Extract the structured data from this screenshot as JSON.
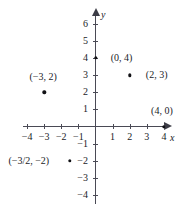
{
  "chart_data": {
    "type": "scatter",
    "title": "",
    "xlabel": "x",
    "ylabel": "y",
    "xlim": [
      -4.6,
      4.4
    ],
    "ylim": [
      -4.6,
      6.6
    ],
    "grid": false,
    "legend": "none",
    "x_ticks": [
      {
        "value": -4,
        "label": "−4"
      },
      {
        "value": -3,
        "label": "−3"
      },
      {
        "value": -2,
        "label": "−2"
      },
      {
        "value": -1,
        "label": "−1"
      },
      {
        "value": 1,
        "label": "1"
      },
      {
        "value": 2,
        "label": "2"
      },
      {
        "value": 3,
        "label": "3"
      },
      {
        "value": 4,
        "label": "4"
      }
    ],
    "y_ticks": [
      {
        "value": 6,
        "label": "6"
      },
      {
        "value": 5,
        "label": "5"
      },
      {
        "value": 4,
        "label": "4"
      },
      {
        "value": 3,
        "label": "3"
      },
      {
        "value": 2,
        "label": "2"
      },
      {
        "value": 1,
        "label": "1"
      },
      {
        "value": -1,
        "label": "−1"
      },
      {
        "value": -2,
        "label": "−2"
      },
      {
        "value": -3,
        "label": "−3"
      },
      {
        "value": -4,
        "label": "−4"
      }
    ],
    "points": [
      {
        "x": 0,
        "y": 4,
        "label": "(0, 4)"
      },
      {
        "x": 2,
        "y": 3,
        "label": "(2, 3)"
      },
      {
        "x": -3,
        "y": 2,
        "label": "(−3, 2)"
      },
      {
        "x": 4,
        "y": 0,
        "label": "(4, 0)"
      },
      {
        "x": -1.5,
        "y": -2,
        "label": "(−3/2, −2)"
      }
    ]
  },
  "axes": {
    "x_name": "x",
    "y_name": "y"
  }
}
